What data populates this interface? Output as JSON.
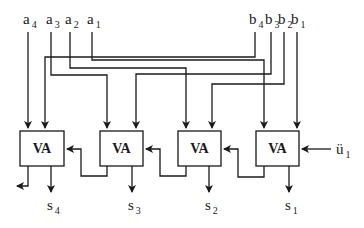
{
  "diagram": {
    "type": "4-bit ripple-carry adder",
    "block_label": "VA",
    "blocks": [
      {
        "id": "va4",
        "label": "VA",
        "sum": "s",
        "sum_index": "4"
      },
      {
        "id": "va3",
        "label": "VA",
        "sum": "s",
        "sum_index": "3"
      },
      {
        "id": "va2",
        "label": "VA",
        "sum": "s",
        "sum_index": "2"
      },
      {
        "id": "va1",
        "label": "VA",
        "sum": "s",
        "sum_index": "1"
      }
    ],
    "inputs_a": [
      {
        "base": "a",
        "index": "4"
      },
      {
        "base": "a",
        "index": "3"
      },
      {
        "base": "a",
        "index": "2"
      },
      {
        "base": "a",
        "index": "1"
      }
    ],
    "inputs_b": [
      {
        "base": "b",
        "index": "4"
      },
      {
        "base": "b",
        "index": "3"
      },
      {
        "base": "b",
        "index": "2"
      },
      {
        "base": "b",
        "index": "1"
      }
    ],
    "carry_in": {
      "base": "ü",
      "index": "1"
    },
    "line_color": "#1a1a1a",
    "background": "#ffffff"
  }
}
